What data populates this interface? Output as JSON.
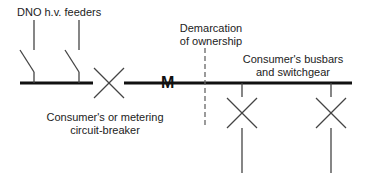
{
  "diagram": {
    "labels": {
      "feeders": "DNO h.v. feeders",
      "demarcation_line1": "Demarcation",
      "demarcation_line2": "of ownership",
      "consumer_busbars_line1": "Consumer's busbars",
      "consumer_busbars_line2": "and switchgear",
      "breaker_line1": "Consumer's or metering",
      "breaker_line2": "circuit-breaker",
      "meter": "M"
    },
    "colors": {
      "line": "#111111",
      "thin_line": "#444444",
      "dashed": "#666666",
      "background": "#ffffff"
    }
  }
}
